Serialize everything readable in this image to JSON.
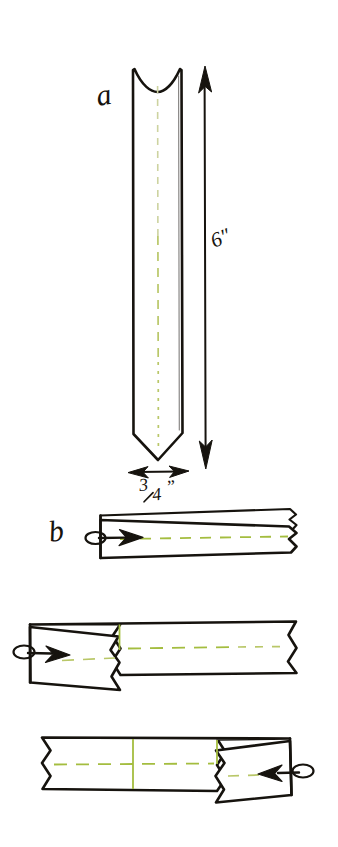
{
  "figure": {
    "background_color": "#ffffff",
    "ink_color": "#16130e",
    "fold_line_color": "#a4bd3f",
    "fold_line_faint_color": "#cdd3a0"
  },
  "panels": [
    {
      "id": "a",
      "letter": "a",
      "description": "Vertical paper strip with notched top and pointed bottom, centre fold line shown dashed",
      "annotations": {
        "height_label": "6″",
        "width_label": "3/4”",
        "width_numerator": "3",
        "width_denominator": "4",
        "width_unit": "”"
      }
    },
    {
      "id": "b",
      "letter": "b",
      "description": "Strip folded lengthwise in half, loop arrow at left pointing right",
      "annotations": {}
    },
    {
      "id": "c",
      "letter": "",
      "description": "Folded strip with left end folded back, vertical crease shown, loop arrow pointing right",
      "annotations": {}
    },
    {
      "id": "d",
      "letter": "",
      "description": "Folded strip with right end folded back, two vertical creases shown, loop arrow pointing left",
      "annotations": {}
    }
  ],
  "labels": {
    "panel_a_letter": "a",
    "panel_b_letter": "b",
    "length_dimension": "6″",
    "width_dimension_numerator": "3",
    "width_dimension_denominator": "4",
    "width_dimension_unit": "”"
  },
  "icons": {
    "length_arrow": "double-headed-vertical-arrow",
    "width_arrow": "double-headed-horizontal-arrow",
    "fold_arrow_right": "loop-tail-arrow-right",
    "fold_arrow_left": "loop-tail-arrow-left"
  }
}
